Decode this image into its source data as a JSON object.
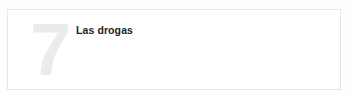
{
  "page": {
    "background_color": "#fefefe"
  },
  "chapter_card": {
    "border_color": "#e6e6e6",
    "background_color": "#ffffff",
    "number": "7",
    "number_color": "#ebebec",
    "title": "Las drogas",
    "title_color": "#1f1f1f",
    "body_text": ""
  }
}
